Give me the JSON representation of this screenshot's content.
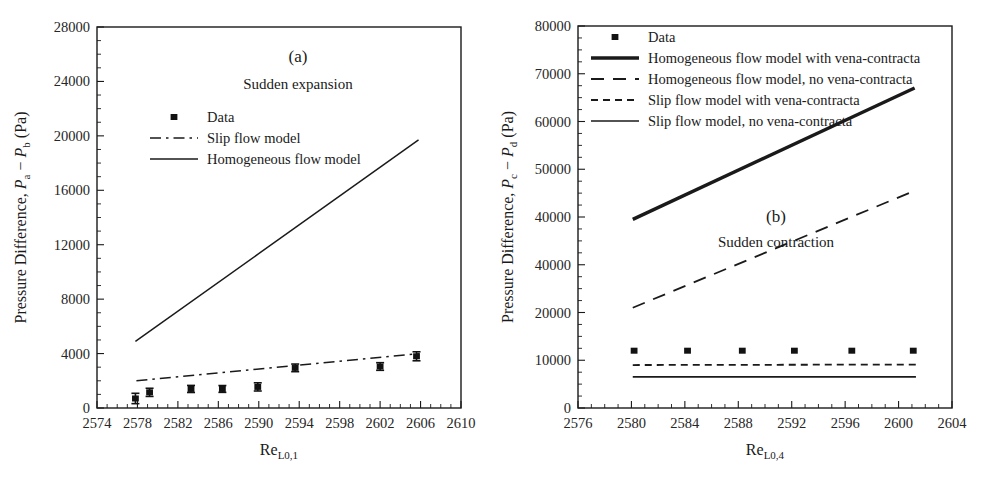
{
  "figure": {
    "background_color": "#ffffff",
    "ink_color": "#1a1a1a"
  },
  "chart_data": [
    {
      "type": "scatter",
      "panel": "a",
      "title": "(a)",
      "subtitle": "Sudden expansion",
      "xlabel_main": "Re",
      "xlabel_sub": "L0,1",
      "ylabel_prefix": "Pressure Difference, ",
      "ylabel_sym1": "P",
      "ylabel_sub1": "a",
      "ylabel_minus": " − ",
      "ylabel_sym2": "P",
      "ylabel_sub2": "b",
      "ylabel_units": " (Pa)",
      "xlim": [
        2574,
        2610
      ],
      "ylim": [
        0,
        28000
      ],
      "xticks": [
        2574,
        2578,
        2582,
        2586,
        2590,
        2594,
        2598,
        2602,
        2606,
        2610
      ],
      "xtick_labels": [
        "2574",
        "2578",
        "2582",
        "2586",
        "2590",
        "2594",
        "2598",
        "2602",
        "2606",
        "2610"
      ],
      "yticks": [
        0,
        4000,
        8000,
        12000,
        16000,
        20000,
        24000,
        28000
      ],
      "ytick_labels": [
        "0",
        "4000",
        "8000",
        "12000",
        "16000",
        "20000",
        "24000",
        "28000"
      ],
      "x_minor_per_major": 4,
      "y_minor_per_major": 4,
      "grid": false,
      "legend_position": "upper-center-left",
      "legend": [
        {
          "label": "Data",
          "style": "marker-square"
        },
        {
          "label": "Slip flow model",
          "style": "dash-dot"
        },
        {
          "label": "Homogeneous flow model",
          "style": "solid"
        }
      ],
      "series": [
        {
          "name": "Data",
          "style": "marker-square",
          "x": [
            2577.8,
            2579.2,
            2583.3,
            2586.4,
            2589.9,
            2593.6,
            2602.0,
            2605.6
          ],
          "y": [
            700,
            1150,
            1400,
            1400,
            1550,
            2950,
            3050,
            3800
          ],
          "yerr": [
            380,
            300,
            260,
            250,
            300,
            280,
            280,
            330
          ]
        },
        {
          "name": "Slip flow model",
          "style": "dash-dot",
          "x": [
            2577.9,
            2605.9
          ],
          "y": [
            2000,
            4000
          ]
        },
        {
          "name": "Homogeneous flow model",
          "style": "solid",
          "x": [
            2577.8,
            2605.8
          ],
          "y": [
            4900,
            19700
          ]
        }
      ]
    },
    {
      "type": "scatter",
      "panel": "b",
      "title": "(b)",
      "subtitle": "Sudden contraction",
      "xlabel_main": "Re",
      "xlabel_sub": "L0,4",
      "ylabel_prefix": "Pressure Difference, ",
      "ylabel_sym1": "P",
      "ylabel_sub1": "c",
      "ylabel_minus": " − ",
      "ylabel_sym2": "P",
      "ylabel_sub2": "d",
      "ylabel_units": " (Pa)",
      "xlim": [
        2576,
        2604
      ],
      "ylim": [
        0,
        80000
      ],
      "xticks": [
        2576,
        2580,
        2584,
        2588,
        2592,
        2596,
        2600,
        2604
      ],
      "xtick_labels": [
        "2576",
        "2580",
        "2584",
        "2588",
        "2592",
        "2596",
        "2600",
        "2604"
      ],
      "yticks": [
        0,
        10000,
        20000,
        30000,
        40000,
        50000,
        60000,
        70000,
        80000
      ],
      "ytick_labels": [
        "0",
        "10000",
        "20000",
        "40000",
        "40000",
        "50000",
        "60000",
        "70000",
        "80000"
      ],
      "x_minor_per_major": 4,
      "y_minor_per_major": 4,
      "grid": false,
      "legend_position": "upper-left",
      "legend": [
        {
          "label": "Data",
          "style": "marker-square"
        },
        {
          "label": "Homogeneous flow model with vena-contracta",
          "style": "solid-thick"
        },
        {
          "label": "Homogeneous flow model, no vena-contracta",
          "style": "long-dash"
        },
        {
          "label": "Slip flow model with vena-contracta",
          "style": "short-dash"
        },
        {
          "label": "Slip flow model, no vena-contracta",
          "style": "solid-thin"
        }
      ],
      "series": [
        {
          "name": "Data",
          "style": "marker-square",
          "x": [
            2580.2,
            2584.2,
            2588.3,
            2592.2,
            2596.5,
            2601.1
          ],
          "y": [
            12000,
            12000,
            12000,
            12000,
            12000,
            12000
          ]
        },
        {
          "name": "Homogeneous flow model with vena-contracta",
          "style": "solid-thick",
          "x": [
            2580.1,
            2601.2
          ],
          "y": [
            39500,
            67000
          ]
        },
        {
          "name": "Homogeneous flow model, no vena-contracta",
          "style": "long-dash",
          "x": [
            2580.1,
            2601.2
          ],
          "y": [
            21000,
            45500
          ]
        },
        {
          "name": "Slip flow model with vena-contracta",
          "style": "short-dash",
          "x": [
            2580.1,
            2601.4
          ],
          "y": [
            9000,
            9100
          ]
        },
        {
          "name": "Slip flow model, no vena-contracta",
          "style": "solid-thin",
          "x": [
            2580.1,
            2601.3
          ],
          "y": [
            6500,
            6500
          ]
        }
      ]
    }
  ]
}
